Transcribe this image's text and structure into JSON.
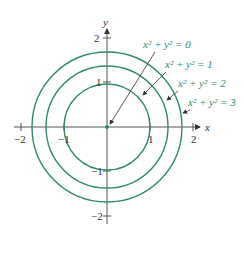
{
  "axes": {
    "x_label": "x",
    "y_label": "y",
    "x_ticks": [
      "−2",
      "−1",
      "1",
      "2"
    ],
    "y_ticks": [
      "2",
      "1",
      "−1",
      "−2"
    ]
  },
  "colors": {
    "curve": "#2e8a6a",
    "axis": "#555555",
    "text": "#333333"
  },
  "level_curves": [
    {
      "equation": "x² + y² = 0",
      "radius": 0
    },
    {
      "equation": "x² + y² = 1",
      "radius": 1
    },
    {
      "equation": "x² + y² = 2",
      "radius": 1.414
    },
    {
      "equation": "x² + y² = 3",
      "radius": 1.732
    }
  ]
}
